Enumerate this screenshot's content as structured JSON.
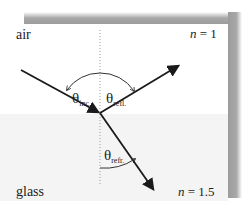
{
  "diagram": {
    "media": [
      {
        "name": "air",
        "label": "air",
        "index_label": "n = 1",
        "index_var": "n",
        "index_value": "1"
      },
      {
        "name": "glass",
        "label": "glass",
        "index_label": "n = 1.5",
        "index_var": "n",
        "index_value": "1.5"
      }
    ],
    "angles": {
      "incident": {
        "symbol": "θ",
        "subscript": "inc."
      },
      "reflected": {
        "symbol": "θ",
        "subscript": "refl."
      },
      "refracted": {
        "symbol": "θ",
        "subscript": "refr."
      }
    },
    "rays": [
      "incident-ray",
      "reflected-ray",
      "refracted-ray"
    ],
    "normal": "dotted normal line",
    "colors": {
      "ray": "#1a1a1a",
      "air_bg": "#ffffff",
      "glass_bg": "#f4f4f4",
      "frame_shadow": "#9a9a9a",
      "normal_line": "#999999"
    }
  }
}
